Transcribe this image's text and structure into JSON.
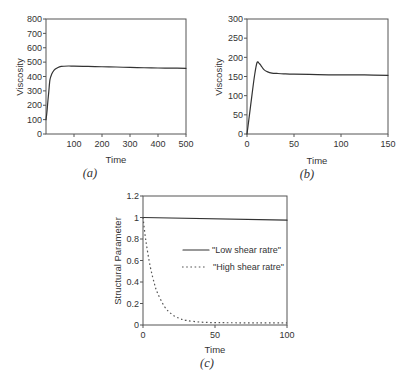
{
  "chart_data": [
    {
      "id": "a",
      "type": "line",
      "title": "",
      "caption": "(a)",
      "xlabel": "Time",
      "ylabel": "Viscosity",
      "xlim": [
        0,
        500
      ],
      "ylim": [
        0,
        800
      ],
      "grid": false,
      "xticks": [
        100,
        200,
        300,
        400,
        500
      ],
      "xtick_labels": [
        "100",
        "200",
        "300",
        "400",
        "500"
      ],
      "yticks": [
        0,
        100,
        200,
        300,
        400,
        500,
        600,
        700,
        800
      ],
      "ytick_labels": [
        "0",
        "100",
        "200",
        "300",
        "400",
        "500",
        "600",
        "700",
        "800"
      ],
      "legend": null,
      "series": [
        {
          "name": "Viscosity",
          "style": "solid",
          "x": [
            0,
            2,
            4,
            7,
            10,
            14,
            20,
            29,
            40,
            54,
            80,
            100,
            150,
            200,
            250,
            300,
            350,
            400,
            450,
            500
          ],
          "y": [
            100,
            130,
            167,
            235,
            295,
            376,
            415,
            445,
            460,
            470,
            473,
            472,
            470,
            468,
            466,
            463,
            461,
            459,
            458,
            457
          ]
        }
      ]
    },
    {
      "id": "b",
      "type": "line",
      "title": "",
      "caption": "(b)",
      "xlabel": "Time",
      "ylabel": "Viscosity",
      "xlim": [
        0,
        150
      ],
      "ylim": [
        0,
        300
      ],
      "grid": false,
      "xticks": [
        0,
        50,
        100,
        150
      ],
      "xtick_labels": [
        "0",
        "50",
        "100",
        "150"
      ],
      "yticks": [
        0,
        50,
        100,
        150,
        200,
        250,
        300
      ],
      "ytick_labels": [
        "0",
        "50",
        "100",
        "150",
        "200",
        "250",
        "300"
      ],
      "legend": null,
      "series": [
        {
          "name": "Viscosity",
          "style": "solid",
          "x": [
            0,
            2,
            5.3,
            8,
            10.6,
            13,
            15,
            18,
            22,
            26.5,
            32,
            39,
            50,
            75,
            100,
            125,
            150
          ],
          "y": [
            0,
            38,
            102,
            152,
            186,
            184,
            178,
            168,
            162,
            159,
            158,
            157,
            156,
            155,
            154,
            154,
            153
          ]
        }
      ]
    },
    {
      "id": "c",
      "type": "line",
      "title": "",
      "caption": "(c)",
      "xlabel": "Time",
      "ylabel": "Structural Parameter",
      "xlim": [
        0,
        100
      ],
      "ylim": [
        0,
        1.2
      ],
      "grid": false,
      "xticks": [
        0,
        50,
        100
      ],
      "xtick_labels": [
        "0",
        "50",
        "100"
      ],
      "yticks": [
        0,
        0.2,
        0.4,
        0.6,
        0.8,
        1,
        1.2
      ],
      "ytick_labels": [
        "0",
        "0.2",
        "0.4",
        "0.6",
        "0.8",
        "1",
        "1.2"
      ],
      "legend": "center-right",
      "series": [
        {
          "name": "\"Low shear ratre\"",
          "style": "solid",
          "x": [
            0,
            100
          ],
          "y": [
            1.0,
            0.975
          ]
        },
        {
          "name": "\"High shear ratre\"",
          "style": "dashed",
          "x": [
            0,
            2,
            5,
            8,
            10,
            15,
            20,
            25,
            30,
            40,
            50,
            60,
            80,
            100
          ],
          "y": [
            1.0,
            0.783,
            0.545,
            0.38,
            0.301,
            0.17,
            0.1,
            0.063,
            0.043,
            0.027,
            0.022,
            0.021,
            0.02,
            0.02
          ]
        }
      ]
    }
  ]
}
